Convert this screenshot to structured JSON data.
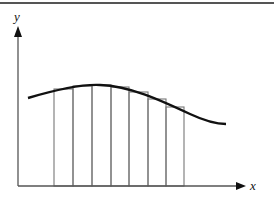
{
  "diagram": {
    "axes": {
      "x_label": "x",
      "y_label": "y",
      "color": "#555555"
    },
    "curve": {
      "color": "#111111",
      "path": "M 28 98 C 55 90, 80 84, 100 85 C 130 86, 160 100, 190 114 C 205 121, 215 124, 226 124"
    },
    "rectangles": [
      {
        "x0": 54,
        "x1": 73,
        "top": 89
      },
      {
        "x0": 73,
        "x1": 92,
        "top": 86
      },
      {
        "x0": 92,
        "x1": 111,
        "top": 85
      },
      {
        "x0": 111,
        "x1": 129,
        "top": 87
      },
      {
        "x0": 129,
        "x1": 148,
        "top": 92
      },
      {
        "x0": 148,
        "x1": 166,
        "top": 99
      },
      {
        "x0": 166,
        "x1": 184,
        "top": 107
      }
    ],
    "rect_color": "#777777",
    "baseline_y": 186
  }
}
